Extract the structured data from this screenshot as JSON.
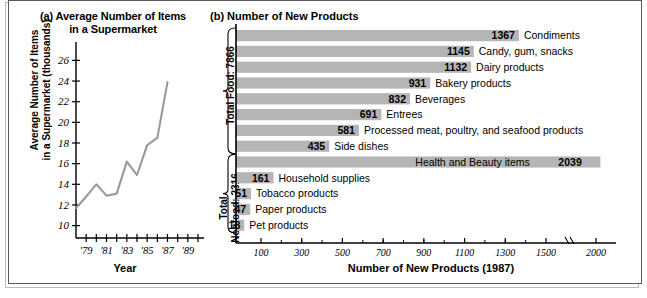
{
  "figure": {
    "panel_a": {
      "tag": "(a)",
      "title_line1": "(a) Average Number of Items",
      "title_line2": "in a Supermarket",
      "ylabel_line1": "Average Number of Items",
      "ylabel_line2": "in a Supermarket (thousands)",
      "xlabel": "Year"
    },
    "panel_b": {
      "title": "(b) Number of  New Products",
      "xlabel": "Number of New Products (1987)",
      "group_food_label": "Total Food: 7866",
      "group_nonfood_label_line1": "Total",
      "group_nonfood_label_line2": "Nonfood: 2316"
    }
  },
  "chart_data": [
    {
      "type": "line",
      "title": "(a) Average Number of Items in a Supermarket",
      "xlabel": "Year",
      "ylabel": "Average Number of Items in a Supermarket (thousands)",
      "x": [
        1978,
        1979,
        1980,
        1981,
        1982,
        1983,
        1984,
        1985,
        1986,
        1987
      ],
      "values": [
        11.7,
        12.8,
        14.0,
        12.9,
        13.1,
        16.2,
        14.9,
        17.8,
        18.5,
        23.9
      ],
      "xtick_labels": [
        "'79",
        "'81",
        "'83",
        "'85",
        "'87",
        "'89"
      ],
      "xtick_values": [
        1979,
        1981,
        1983,
        1985,
        1987,
        1989
      ],
      "ytick_labels": [
        "10",
        "12",
        "14",
        "16",
        "18",
        "20",
        "22",
        "24",
        "26"
      ],
      "ytick_values": [
        10,
        12,
        14,
        16,
        18,
        20,
        22,
        24,
        26
      ],
      "xlim": [
        1978,
        1990
      ],
      "ylim": [
        8.8,
        27.2
      ],
      "grid": false,
      "legend": "none",
      "line_color": "#9a9a9a"
    },
    {
      "type": "bar",
      "orientation": "horizontal",
      "title": "(b) Number of  New Products",
      "xlabel": "Number of New Products (1987)",
      "ylabel": "",
      "bar_color": "#b5b5b5",
      "grid": false,
      "legend": "none",
      "xtick_labels": [
        "100",
        "300",
        "500",
        "700",
        "900",
        "1100",
        "1300",
        "1500",
        "2000"
      ],
      "xtick_values": [
        100,
        300,
        500,
        700,
        900,
        1100,
        1300,
        1500,
        2000
      ],
      "axis_break_between": [
        1500,
        2000
      ],
      "groups": [
        {
          "name": "Total Food: 7866",
          "total": 7866
        },
        {
          "name": "Total Nonfood: 2316",
          "total": 2316
        }
      ],
      "categories": [
        "Condiments",
        "Candy, gum, snacks",
        "Dairy products",
        "Bakery products",
        "Beverages",
        "Entrees",
        "Processed meat, poultry, and seafood products",
        "Side dishes",
        "Health and Beauty items",
        "Household supplies",
        "Tobacco products",
        "Paper products",
        "Pet products"
      ],
      "values": [
        1367,
        1145,
        1132,
        931,
        832,
        691,
        581,
        435,
        2039,
        161,
        51,
        47,
        18
      ],
      "bars": [
        {
          "label": "Condiments",
          "value": 1367,
          "value_text": "1367",
          "group": "food",
          "label_inside": false
        },
        {
          "label": "Candy, gum, snacks",
          "value": 1145,
          "value_text": "1145",
          "group": "food",
          "label_inside": false
        },
        {
          "label": "Dairy products",
          "value": 1132,
          "value_text": "1132",
          "group": "food",
          "label_inside": false
        },
        {
          "label": "Bakery products",
          "value": 931,
          "value_text": "931",
          "group": "food",
          "label_inside": false
        },
        {
          "label": "Beverages",
          "value": 832,
          "value_text": "832",
          "group": "food",
          "label_inside": false
        },
        {
          "label": "Entrees",
          "value": 691,
          "value_text": "691",
          "group": "food",
          "label_inside": false
        },
        {
          "label": "Processed meat, poultry, and seafood products",
          "value": 581,
          "value_text": "581",
          "group": "food",
          "label_inside": false
        },
        {
          "label": "Side dishes",
          "value": 435,
          "value_text": "435",
          "group": "food",
          "label_inside": false
        },
        {
          "label": "Health and Beauty items",
          "value": 2039,
          "value_text": "2039",
          "group": "nonfood",
          "label_inside": true
        },
        {
          "label": "Household supplies",
          "value": 161,
          "value_text": "161",
          "group": "nonfood",
          "label_inside": false
        },
        {
          "label": "Tobacco products",
          "value": 51,
          "value_text": "51",
          "group": "nonfood",
          "label_inside": false
        },
        {
          "label": "Paper products",
          "value": 47,
          "value_text": "47",
          "group": "nonfood",
          "label_inside": false
        },
        {
          "label": "Pet products",
          "value": 18,
          "value_text": "18",
          "group": "nonfood",
          "label_inside": false
        }
      ]
    }
  ]
}
